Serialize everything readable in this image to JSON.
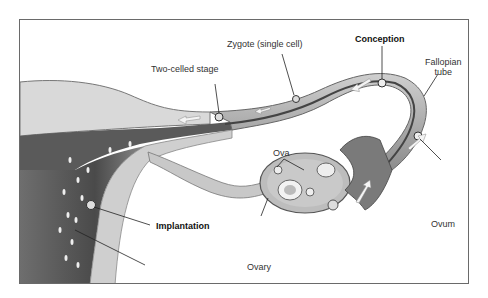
{
  "diagram": {
    "labels": {
      "two_celled_stage": "Two-celled stage",
      "zygote": "Zygote (single cell)",
      "conception": "Conception",
      "fallopian_tube_line1": "Fallopian",
      "fallopian_tube_line2": "tube",
      "ova": "Ova",
      "ovum": "Ovum",
      "ovary": "Ovary",
      "implantation": "Implantation",
      "sperm": "Sperm"
    },
    "colors": {
      "frame": "#6a6a6a",
      "tissue_light": "#d8d8d8",
      "tissue_mid": "#a8a8a8",
      "tissue_dark": "#555555",
      "text": "#333333"
    }
  }
}
